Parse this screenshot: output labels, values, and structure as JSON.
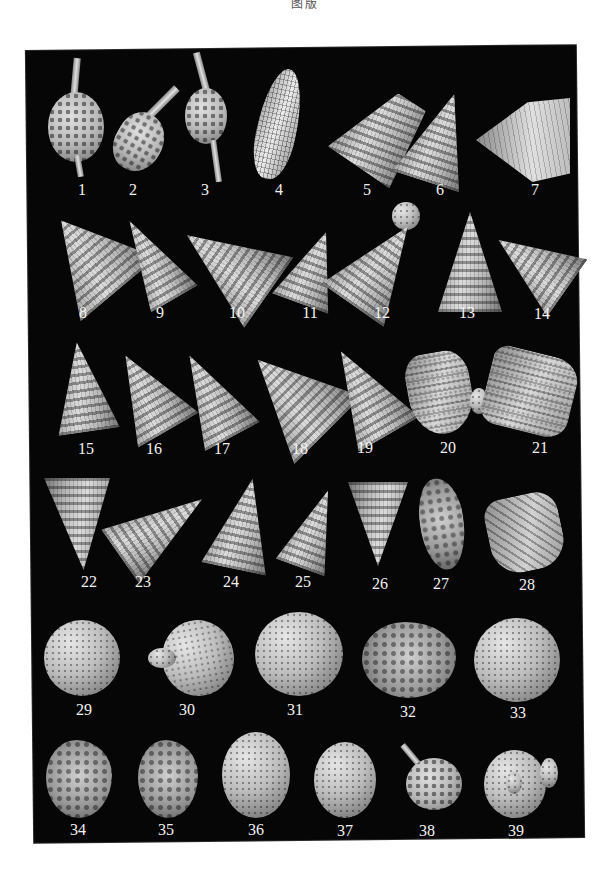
{
  "page": {
    "header_text": "图版",
    "background_color": "#ffffff",
    "plate_color": "#060606",
    "label_color": "#f2f2f2"
  },
  "plate": {
    "rows": [
      {
        "row": 1,
        "specimens": [
          {
            "label": "1",
            "form": "spiny-ovoid",
            "lx": 82,
            "ly": 186
          },
          {
            "label": "2",
            "form": "spiny-fusiform",
            "lx": 133,
            "ly": 186
          },
          {
            "label": "3",
            "form": "bipolar-spined",
            "lx": 205,
            "ly": 186
          },
          {
            "label": "4",
            "form": "elongate-latticed",
            "lx": 279,
            "ly": 186
          },
          {
            "label": "5",
            "form": "conical-latticed",
            "lx": 367,
            "ly": 186
          },
          {
            "label": "6",
            "form": "conical-ribbed",
            "lx": 440,
            "ly": 186
          },
          {
            "label": "7",
            "form": "fan-shaped",
            "lx": 535,
            "ly": 186
          }
        ]
      },
      {
        "row": 2,
        "specimens": [
          {
            "label": "8",
            "form": "multi-segmented-cone",
            "lx": 83,
            "ly": 308
          },
          {
            "label": "9",
            "form": "multi-segmented-cone",
            "lx": 160,
            "ly": 308
          },
          {
            "label": "10",
            "form": "multi-segmented-cone",
            "lx": 237,
            "ly": 308
          },
          {
            "label": "11",
            "form": "multi-segmented-cone",
            "lx": 310,
            "ly": 308
          },
          {
            "label": "12",
            "form": "capped-cone",
            "lx": 382,
            "ly": 308
          },
          {
            "label": "13",
            "form": "tall-cone",
            "lx": 467,
            "ly": 308
          },
          {
            "label": "14",
            "form": "nodose-cone",
            "lx": 542,
            "ly": 308
          }
        ]
      },
      {
        "row": 3,
        "specimens": [
          {
            "label": "15",
            "form": "tall-cone",
            "lx": 86,
            "ly": 444
          },
          {
            "label": "16",
            "form": "multi-segmented-cone",
            "lx": 154,
            "ly": 444
          },
          {
            "label": "17",
            "form": "tall-cone",
            "lx": 222,
            "ly": 444
          },
          {
            "label": "18",
            "form": "nodose-cone",
            "lx": 300,
            "ly": 444
          },
          {
            "label": "19",
            "form": "nodose-cone",
            "lx": 365,
            "ly": 444
          },
          {
            "label": "20",
            "form": "ribbed-bell",
            "lx": 448,
            "ly": 444
          },
          {
            "label": "21",
            "form": "truncated-nodose",
            "lx": 540,
            "ly": 444
          }
        ]
      },
      {
        "row": 4,
        "specimens": [
          {
            "label": "22",
            "form": "inverted-cone",
            "lx": 89,
            "ly": 576
          },
          {
            "label": "23",
            "form": "ringed-cone",
            "lx": 143,
            "ly": 576
          },
          {
            "label": "24",
            "form": "tall-cone",
            "lx": 231,
            "ly": 576
          },
          {
            "label": "25",
            "form": "multi-segmented-cone",
            "lx": 303,
            "ly": 576
          },
          {
            "label": "26",
            "form": "inverted-ringed-cone",
            "lx": 380,
            "ly": 576
          },
          {
            "label": "27",
            "form": "irregular-fusiform",
            "lx": 441,
            "ly": 576
          },
          {
            "label": "28",
            "form": "obliquely-ribbed",
            "lx": 527,
            "ly": 576
          }
        ]
      },
      {
        "row": 5,
        "specimens": [
          {
            "label": "29",
            "form": "latticed-sphere",
            "lx": 84,
            "ly": 703
          },
          {
            "label": "30",
            "form": "sphere-with-process",
            "lx": 187,
            "ly": 703
          },
          {
            "label": "31",
            "form": "latticed-sphere",
            "lx": 295,
            "ly": 703
          },
          {
            "label": "32",
            "form": "rough-sphere",
            "lx": 408,
            "ly": 703
          },
          {
            "label": "33",
            "form": "latticed-sphere",
            "lx": 518,
            "ly": 703
          }
        ]
      },
      {
        "row": 6,
        "specimens": [
          {
            "label": "34",
            "form": "rough-ovoid",
            "lx": 78,
            "ly": 822
          },
          {
            "label": "35",
            "form": "rough-ovoid",
            "lx": 166,
            "ly": 822
          },
          {
            "label": "36",
            "form": "latticed-ovoid",
            "lx": 256,
            "ly": 822
          },
          {
            "label": "37",
            "form": "latticed-ovoid",
            "lx": 345,
            "ly": 822
          },
          {
            "label": "38",
            "form": "spiny-sphere-with-horn",
            "lx": 427,
            "ly": 822
          },
          {
            "label": "39",
            "form": "disc-with-boss",
            "lx": 516,
            "ly": 822
          }
        ]
      }
    ]
  }
}
